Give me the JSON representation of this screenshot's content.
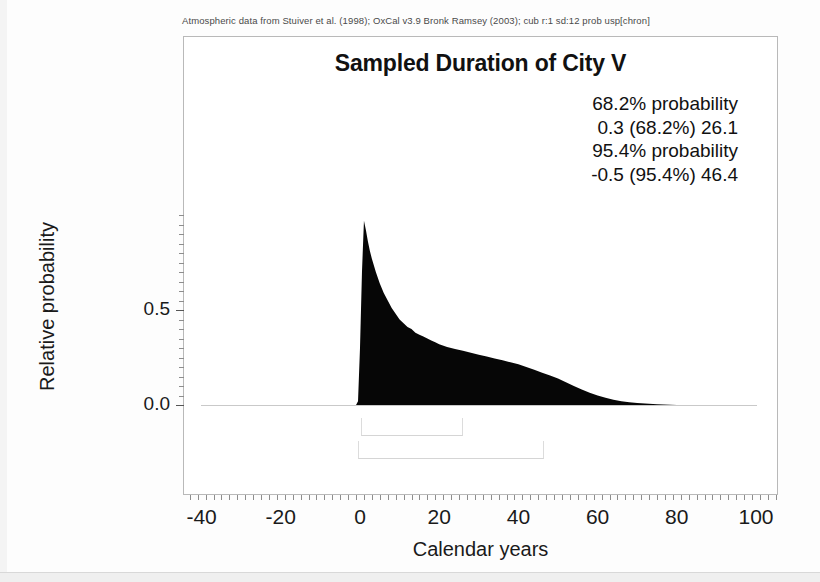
{
  "caption": "Atmospheric data from Stuiver et al. (1998); OxCal v3.9 Bronk Ramsey (2003); cub r:1 sd:12 prob usp[chron]",
  "title": "Sampled Duration of City V",
  "stats": {
    "line1": "68.2% probability",
    "line2": "0.3 (68.2%) 26.1",
    "line3": "95.4% probability",
    "line4": "-0.5 (95.4%) 46.4"
  },
  "axes": {
    "ylabel": "Relative probability",
    "xlabel": "Calendar years",
    "ytick_labels": [
      "0.5",
      "0.0"
    ],
    "xtick_labels": [
      "-40",
      "-20",
      "0",
      "20",
      "40",
      "60",
      "80",
      "100"
    ]
  },
  "chart_data": {
    "type": "area",
    "title": "Sampled Duration of City V",
    "subtitle": "Atmospheric data from Stuiver et al. (1998); OxCal v3.9 Bronk Ramsey (2003); cub r:1 sd:12 prob usp[chron]",
    "xlabel": "Calendar years",
    "ylabel": "Relative probability",
    "xlim": [
      -45,
      105
    ],
    "ylim": [
      0.0,
      1.05
    ],
    "xticks": [
      -40,
      -20,
      0,
      20,
      40,
      60,
      80,
      100
    ],
    "yticks": [
      0.0,
      0.5
    ],
    "grid": false,
    "legend": "none",
    "fill_color": "#000000",
    "x": [
      -1.0,
      -0.5,
      0.0,
      0.5,
      1.0,
      1.5,
      2.0,
      2.5,
      3.0,
      4.0,
      5.0,
      6.0,
      7.0,
      8.0,
      9.0,
      10.0,
      11.0,
      12.0,
      13.0,
      14.0,
      15.0,
      16.0,
      17.0,
      18.0,
      19.0,
      20.0,
      22.0,
      24.0,
      26.0,
      28.0,
      30.0,
      32.0,
      34.0,
      36.0,
      38.0,
      40.0,
      42.0,
      44.0,
      46.0,
      48.0,
      50.0,
      52.0,
      54.0,
      56.0,
      58.0,
      60.0,
      62.0,
      64.0,
      66.0,
      68.0,
      70.0,
      75.0,
      80.0
    ],
    "y": [
      0.0,
      0.02,
      0.3,
      0.7,
      0.97,
      0.92,
      0.86,
      0.81,
      0.77,
      0.7,
      0.64,
      0.59,
      0.55,
      0.51,
      0.48,
      0.45,
      0.43,
      0.41,
      0.4,
      0.38,
      0.37,
      0.36,
      0.35,
      0.34,
      0.33,
      0.32,
      0.305,
      0.295,
      0.285,
      0.275,
      0.265,
      0.255,
      0.245,
      0.235,
      0.225,
      0.215,
      0.2,
      0.185,
      0.17,
      0.155,
      0.14,
      0.12,
      0.1,
      0.082,
      0.065,
      0.05,
      0.038,
      0.028,
      0.02,
      0.014,
      0.01,
      0.004,
      0.0
    ],
    "ranges": [
      {
        "label": "68.2% probability",
        "text": "0.3 (68.2%) 26.1",
        "from": 0.3,
        "to": 26.1,
        "probability": 68.2
      },
      {
        "label": "95.4% probability",
        "text": "-0.5 (95.4%) 46.4",
        "from": -0.5,
        "to": 46.4,
        "probability": 95.4
      }
    ]
  }
}
